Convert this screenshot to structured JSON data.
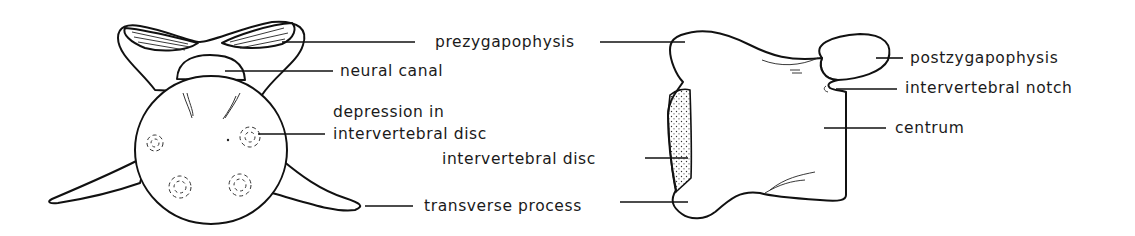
{
  "figure": {
    "left_view": {
      "name": "vertebra-anterior-view",
      "labels": {
        "prezygapophysis": "prezygapophysis",
        "neural_canal": "neural canal",
        "depression_line1": "depression in",
        "depression_line2": "intervertebral disc",
        "transverse_process": "transverse process"
      }
    },
    "right_view": {
      "name": "vertebra-lateral-view",
      "labels": {
        "postzygapophysis": "postzygapophysis",
        "intervertebral_notch": "intervertebral notch",
        "centrum": "centrum",
        "intervertebral_disc": "intervertebral disc"
      }
    },
    "colors": {
      "line": "#111111",
      "text": "#1a1a1a",
      "background": "#ffffff"
    }
  }
}
